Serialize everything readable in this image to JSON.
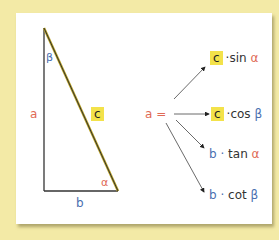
{
  "triangle": {
    "side_a": "a",
    "side_b": "b",
    "side_c": "c",
    "angle_alpha": "α",
    "angle_beta": "β"
  },
  "equation": {
    "lhs": "a =",
    "results": [
      {
        "factor": "c",
        "op": "·sin",
        "angle": "α"
      },
      {
        "factor": "c",
        "op": "·cos",
        "angle": "β"
      },
      {
        "factor": "b ·",
        "op": "tan",
        "angle": "α"
      },
      {
        "factor": "b ·",
        "op": "cot",
        "angle": "β"
      }
    ]
  },
  "colors": {
    "background": "#f3eaa6",
    "highlight": "#f3e24a",
    "red": "#e06a55",
    "blue": "#4a6fb0"
  }
}
